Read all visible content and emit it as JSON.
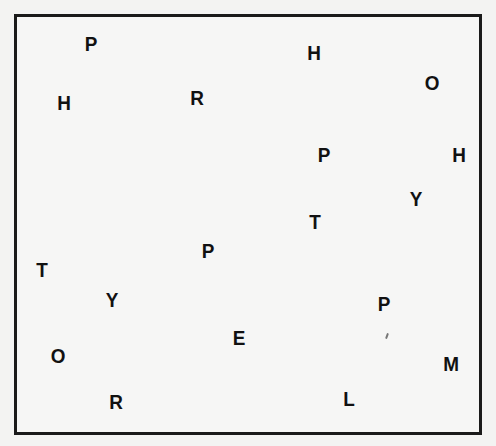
{
  "board": {
    "letters": [
      {
        "char": "P",
        "x": 91,
        "y": 43
      },
      {
        "char": "H",
        "x": 64,
        "y": 102
      },
      {
        "char": "R",
        "x": 197,
        "y": 97
      },
      {
        "char": "H",
        "x": 314,
        "y": 52
      },
      {
        "char": "O",
        "x": 432,
        "y": 82
      },
      {
        "char": "P",
        "x": 324,
        "y": 154
      },
      {
        "char": "H",
        "x": 459,
        "y": 154
      },
      {
        "char": "Y",
        "x": 416,
        "y": 198
      },
      {
        "char": "T",
        "x": 315,
        "y": 221
      },
      {
        "char": "P",
        "x": 208,
        "y": 250
      },
      {
        "char": "T",
        "x": 42,
        "y": 269
      },
      {
        "char": "Y",
        "x": 112,
        "y": 299
      },
      {
        "char": "P",
        "x": 384,
        "y": 303
      },
      {
        "char": "E",
        "x": 239,
        "y": 337
      },
      {
        "char": "O",
        "x": 58,
        "y": 355
      },
      {
        "char": "M",
        "x": 451,
        "y": 363
      },
      {
        "char": "R",
        "x": 116,
        "y": 401
      },
      {
        "char": "L",
        "x": 349,
        "y": 398
      }
    ]
  },
  "colors": {
    "background": "#f3f3f2",
    "border": "#1a1a1a",
    "letter": "#111111"
  }
}
